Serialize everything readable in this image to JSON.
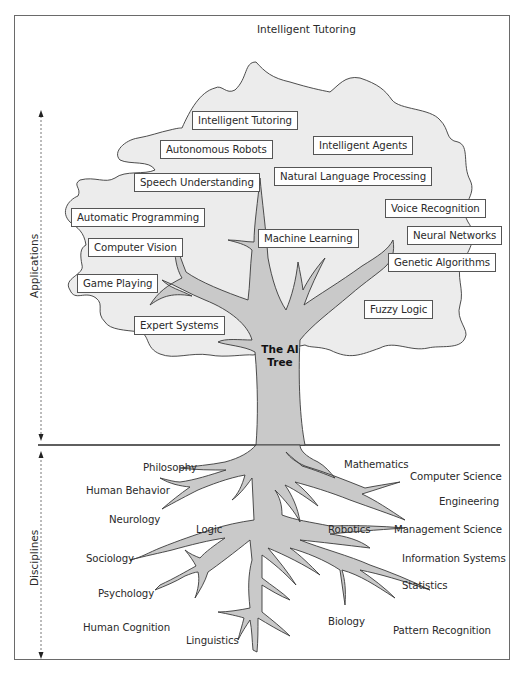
{
  "title": "Intelligent Tutoring",
  "tree_label": [
    "The AI",
    "Tree"
  ],
  "axis": {
    "applications": "Applications",
    "disciplines": "Disciplines"
  },
  "colors": {
    "cloud_fill": "#ececec",
    "tree_fill": "#c9c9c9",
    "outline": "#3a3a3a",
    "frame": "#6a6a6a"
  },
  "applications": [
    {
      "label": "Intelligent Tutoring"
    },
    {
      "label": "Autonomous Robots"
    },
    {
      "label": "Intelligent Agents"
    },
    {
      "label": "Speech Understanding"
    },
    {
      "label": "Natural Language Processing"
    },
    {
      "label": "Automatic Programming"
    },
    {
      "label": "Voice Recognition"
    },
    {
      "label": "Computer Vision"
    },
    {
      "label": "Machine Learning"
    },
    {
      "label": "Neural Networks"
    },
    {
      "label": "Genetic Algorithms"
    },
    {
      "label": "Game Playing"
    },
    {
      "label": "Fuzzy Logic"
    },
    {
      "label": "Expert Systems"
    }
  ],
  "disciplines": [
    {
      "label": "Philosophy"
    },
    {
      "label": "Mathematics"
    },
    {
      "label": "Computer Science"
    },
    {
      "label": "Human Behavior"
    },
    {
      "label": "Engineering"
    },
    {
      "label": "Neurology"
    },
    {
      "label": "Logic"
    },
    {
      "label": "Robotics"
    },
    {
      "label": "Management Science"
    },
    {
      "label": "Sociology"
    },
    {
      "label": "Information Systems"
    },
    {
      "label": "Statistics"
    },
    {
      "label": "Psychology"
    },
    {
      "label": "Biology"
    },
    {
      "label": "Human Cognition"
    },
    {
      "label": "Linguistics"
    },
    {
      "label": "Pattern Recognition"
    }
  ]
}
